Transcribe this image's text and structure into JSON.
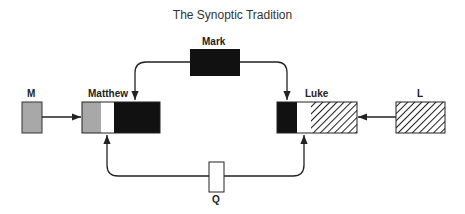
{
  "title": "The Synoptic Tradition",
  "nodes": {
    "mark": {
      "label": "Mark"
    },
    "matthew": {
      "label": "Matthew"
    },
    "luke": {
      "label": "Luke"
    },
    "m": {
      "label": "M"
    },
    "l": {
      "label": "L"
    },
    "q": {
      "label": "Q"
    }
  },
  "colors": {
    "gray": "#a8a8a8",
    "black": "#111111",
    "white": "#ffffff",
    "line": "#222222"
  },
  "edges": [
    {
      "from": "Mark",
      "to": "Matthew"
    },
    {
      "from": "Mark",
      "to": "Luke"
    },
    {
      "from": "M",
      "to": "Matthew"
    },
    {
      "from": "L",
      "to": "Luke"
    },
    {
      "from": "Q",
      "to": "Matthew"
    },
    {
      "from": "Q",
      "to": "Luke"
    }
  ]
}
